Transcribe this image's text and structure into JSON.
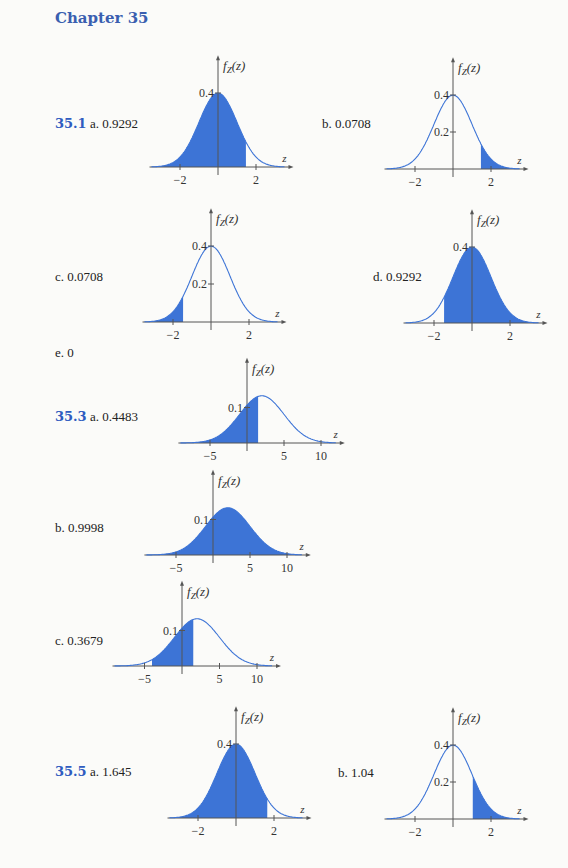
{
  "chapter_title": "Chapter 35",
  "problems": [
    {
      "number": "35.1",
      "parts": [
        {
          "label": "a.",
          "answer": "0.9292"
        },
        {
          "label": "b.",
          "answer": "0.0708"
        },
        {
          "label": "c.",
          "answer": "0.0708"
        },
        {
          "label": "d.",
          "answer": "0.9292"
        },
        {
          "label": "e.",
          "answer": "0"
        }
      ]
    },
    {
      "number": "35.3",
      "parts": [
        {
          "label": "a.",
          "answer": "0.4483"
        },
        {
          "label": "b.",
          "answer": "0.9998"
        },
        {
          "label": "c.",
          "answer": "0.3679"
        }
      ]
    },
    {
      "number": "35.5",
      "parts": [
        {
          "label": "a.",
          "answer": "1.645"
        },
        {
          "label": "b.",
          "answer": "1.04"
        }
      ]
    }
  ],
  "colors": {
    "fill": "#3d74d6",
    "curve": "#3d74d6",
    "axis": "#555555",
    "heading": "#3a5fb0"
  },
  "chart_data": [
    {
      "id": "35.1a",
      "type": "area",
      "title": "",
      "ylabel": "f_Z(z)",
      "xlabel": "z",
      "distribution": {
        "mean": 0,
        "sd": 1
      },
      "x_ticks": [
        -2,
        2
      ],
      "y_ticks": [
        0.4
      ],
      "shaded": [
        null,
        1.47
      ],
      "xlim": [
        -3.5,
        3.5
      ]
    },
    {
      "id": "35.1b",
      "type": "area",
      "ylabel": "f_Z(z)",
      "xlabel": "z",
      "distribution": {
        "mean": 0,
        "sd": 1
      },
      "x_ticks": [
        -2,
        2
      ],
      "y_ticks": [
        0.2,
        0.4
      ],
      "shaded": [
        1.47,
        null
      ],
      "xlim": [
        -3.5,
        3.5
      ]
    },
    {
      "id": "35.1c",
      "type": "area",
      "ylabel": "f_Z(z)",
      "xlabel": "z",
      "distribution": {
        "mean": 0,
        "sd": 1
      },
      "x_ticks": [
        -2,
        2
      ],
      "y_ticks": [
        0.2,
        0.4
      ],
      "shaded": [
        null,
        -1.47
      ],
      "xlim": [
        -3.5,
        3.5
      ]
    },
    {
      "id": "35.1d",
      "type": "area",
      "ylabel": "f_Z(z)",
      "xlabel": "z",
      "distribution": {
        "mean": 0,
        "sd": 1
      },
      "x_ticks": [
        -2,
        2
      ],
      "y_ticks": [
        0.4
      ],
      "shaded": [
        -1.47,
        null
      ],
      "xlim": [
        -3.5,
        3.5
      ]
    },
    {
      "id": "35.3a",
      "type": "area",
      "ylabel": "f_Z(z)",
      "xlabel": "z",
      "distribution": {
        "mean": 2,
        "sd": 3
      },
      "x_ticks": [
        -5,
        5,
        10
      ],
      "y_ticks": [
        0.1
      ],
      "shaded": [
        null,
        1.5
      ],
      "xlim": [
        -9,
        12
      ]
    },
    {
      "id": "35.3b",
      "type": "area",
      "ylabel": "f_Z(z)",
      "xlabel": "z",
      "distribution": {
        "mean": 2,
        "sd": 3
      },
      "x_ticks": [
        -5,
        5,
        10
      ],
      "y_ticks": [
        0.1
      ],
      "shaded": [
        -8,
        12
      ],
      "xlim": [
        -9,
        12
      ]
    },
    {
      "id": "35.3c",
      "type": "area",
      "ylabel": "f_Z(z)",
      "xlabel": "z",
      "distribution": {
        "mean": 2,
        "sd": 3
      },
      "x_ticks": [
        -5,
        5,
        10
      ],
      "y_ticks": [
        0.1
      ],
      "shaded": [
        -4,
        1.5
      ],
      "xlim": [
        -9,
        12
      ]
    },
    {
      "id": "35.5a",
      "type": "area",
      "ylabel": "f_Z(z)",
      "xlabel": "z",
      "distribution": {
        "mean": 0,
        "sd": 1
      },
      "x_ticks": [
        -2,
        2
      ],
      "y_ticks": [
        0.4
      ],
      "shaded": [
        null,
        1.645
      ],
      "xlim": [
        -3.5,
        3.5
      ]
    },
    {
      "id": "35.5b",
      "type": "area",
      "ylabel": "f_Z(z)",
      "xlabel": "z",
      "distribution": {
        "mean": 0,
        "sd": 1
      },
      "x_ticks": [
        -2,
        2
      ],
      "y_ticks": [
        0.2,
        0.4
      ],
      "shaded": [
        1.04,
        null
      ],
      "xlim": [
        -3.5,
        3.5
      ]
    }
  ]
}
